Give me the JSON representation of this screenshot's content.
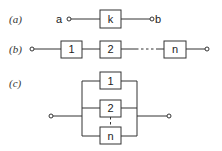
{
  "diagram": {
    "row_a": {
      "label": "(a)",
      "terminal_left": "a",
      "terminal_right": "b",
      "block": "k"
    },
    "row_b": {
      "label": "(b)",
      "blocks": [
        "1",
        "2",
        "n"
      ]
    },
    "row_c": {
      "label": "(c)",
      "blocks": [
        "1",
        "2",
        "n"
      ]
    },
    "colors": {
      "stroke": "#333333",
      "background": "#ffffff"
    }
  }
}
